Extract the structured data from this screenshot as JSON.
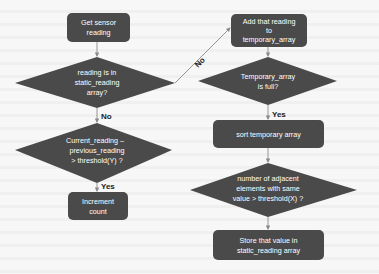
{
  "colors": {
    "node_fill": "#4a4a4a",
    "node_text": "#ffffff",
    "edge_stroke": "#8a8a8a",
    "label_text": "#222222",
    "background": "#f7f7f7"
  },
  "nodes": {
    "get_sensor": {
      "type": "process",
      "lines": [
        "Get sensor",
        "reading"
      ]
    },
    "in_static": {
      "type": "decision",
      "lines": [
        "reading is in",
        "static_reading",
        "array?"
      ]
    },
    "diff_threshold": {
      "type": "decision",
      "lines": [
        "Current_reading –",
        "previous_reading",
        "> threshold(Y) ?"
      ]
    },
    "increment": {
      "type": "process",
      "lines": [
        "Increment",
        "count"
      ]
    },
    "add_temp": {
      "type": "process",
      "lines": [
        "Add that reading",
        "to",
        "temporary_array"
      ]
    },
    "temp_full": {
      "type": "decision",
      "lines": [
        "Temporary_array",
        "is full?"
      ]
    },
    "sort_temp": {
      "type": "process",
      "lines": [
        "sort temporary array"
      ]
    },
    "adjacent_check": {
      "type": "decision",
      "lines": [
        "number of adjacent",
        "elements with same",
        "value > threshold(X) ?"
      ]
    },
    "store_static": {
      "type": "process",
      "lines": [
        "Store that value in",
        "static_reading array"
      ]
    }
  },
  "edges": [
    {
      "from": "get_sensor",
      "to": "in_static",
      "label": ""
    },
    {
      "from": "in_static",
      "to": "diff_threshold",
      "label": "No"
    },
    {
      "from": "in_static",
      "to": "add_temp",
      "label": "No"
    },
    {
      "from": "diff_threshold",
      "to": "increment",
      "label": "Yes"
    },
    {
      "from": "add_temp",
      "to": "temp_full",
      "label": ""
    },
    {
      "from": "temp_full",
      "to": "sort_temp",
      "label": "Yes"
    },
    {
      "from": "sort_temp",
      "to": "adjacent_check",
      "label": ""
    },
    {
      "from": "adjacent_check",
      "to": "store_static",
      "label": ""
    }
  ]
}
